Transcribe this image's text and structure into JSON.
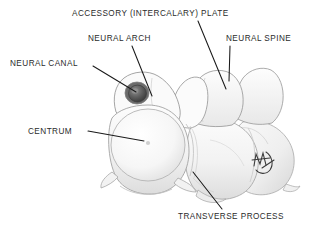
{
  "figure": {
    "background_color": "#ffffff",
    "text_color": "#2b2b2b",
    "leader_line_color": "#1a1a1a",
    "bone_line_color": "#9a9a9a",
    "bone_fill_color": "#f7f7f7",
    "shade_color": "#d8d8d8",
    "canal_fill_color": "#5a5a5a",
    "signature": "artist-monogram"
  },
  "labels": [
    {
      "id": "accessory-plate",
      "text": "ACCESSORY (INTERCALARY) PLATE",
      "x": 72,
      "y": 9,
      "leader": {
        "x1": 198,
        "y1": 21,
        "x2": 226,
        "y2": 89
      }
    },
    {
      "id": "neural-arch",
      "text": "NEURAL ARCH",
      "x": 88,
      "y": 34,
      "leader": {
        "x1": 132,
        "y1": 46,
        "x2": 152,
        "y2": 96
      }
    },
    {
      "id": "neural-spine",
      "text": "NEURAL SPINE",
      "x": 226,
      "y": 34,
      "leader": {
        "x1": 230,
        "y1": 46,
        "x2": 229,
        "y2": 81
      }
    },
    {
      "id": "neural-canal",
      "text": "NEURAL CANAL",
      "x": 10,
      "y": 59,
      "leader": {
        "x1": 93,
        "y1": 66,
        "x2": 136,
        "y2": 92
      }
    },
    {
      "id": "centrum",
      "text": "CENTRUM",
      "x": 28,
      "y": 127,
      "leader": {
        "x1": 88,
        "y1": 131,
        "x2": 144,
        "y2": 141
      }
    },
    {
      "id": "transverse-process",
      "text": "TRANSVERSE PROCESS",
      "x": 178,
      "y": 212,
      "leader": {
        "x1": 193,
        "y1": 172,
        "x2": 222,
        "y2": 209
      }
    }
  ],
  "anatomy_features": [
    {
      "id": "neural-canal-opening",
      "cx": 137,
      "cy": 93,
      "rx": 11,
      "ry": 10
    },
    {
      "id": "centrum-face",
      "cx": 148,
      "cy": 145,
      "rx": 38,
      "ry": 36
    },
    {
      "id": "notochordal-pit",
      "cx": 148,
      "cy": 143,
      "r": 2
    },
    {
      "id": "spine-foramen-1",
      "cx": 196,
      "cy": 95,
      "r": 1.6
    },
    {
      "id": "spine-foramen-2",
      "cx": 217,
      "cy": 84,
      "r": 1.6
    },
    {
      "id": "spine-foramen-3",
      "cx": 230,
      "cy": 95,
      "r": 1.6
    }
  ]
}
